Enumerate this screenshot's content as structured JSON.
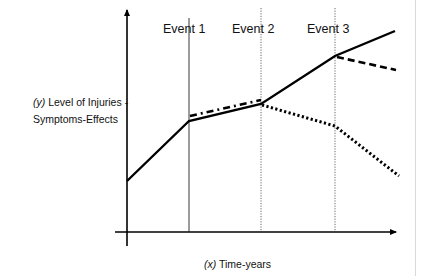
{
  "diagram": {
    "y_axis_label": {
      "var": "(y)",
      "line1": " Level of Injuries -",
      "line2": "Symptoms-Effects"
    },
    "x_axis_label": {
      "var": "(x)",
      "text": " Time-years"
    },
    "events": [
      {
        "label": "Event 1",
        "style": "solid"
      },
      {
        "label": "Event 2",
        "style": "dotted"
      },
      {
        "label": "Event 3",
        "style": "dotted"
      }
    ],
    "lines": [
      {
        "name": "baseline-trajectory",
        "style": "solid",
        "points": [
          [
            0,
            0.2
          ],
          [
            1,
            0.47
          ],
          [
            2,
            0.55
          ],
          [
            3,
            0.77
          ],
          [
            4,
            0.88
          ]
        ]
      },
      {
        "name": "event1-alternative",
        "style": "dash-dot",
        "points": [
          [
            1,
            0.49
          ],
          [
            2,
            0.57
          ]
        ]
      },
      {
        "name": "event2-alternative",
        "style": "dotted",
        "points": [
          [
            2,
            0.55
          ],
          [
            3,
            0.45
          ],
          [
            4,
            0.23
          ]
        ]
      },
      {
        "name": "event3-alternative",
        "style": "dashed",
        "points": [
          [
            3,
            0.77
          ],
          [
            4,
            0.71
          ]
        ]
      }
    ]
  },
  "colors": {
    "line": "#000000",
    "border": "#d9d9d9",
    "text": "#111111"
  }
}
